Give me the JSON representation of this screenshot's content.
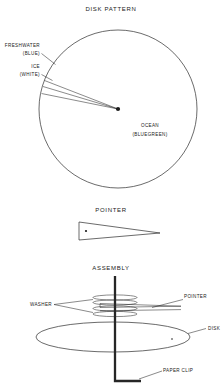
{
  "document": {
    "title": "Disk Pattern, Pointer and Assembly Diagram",
    "background_color": "#ffffff",
    "ink_color": "#2b2b2b"
  },
  "panels": {
    "disk_pattern": {
      "title": "DISK PATTERN",
      "labels": {
        "freshwater_line1": "FRESHWATER",
        "freshwater_line2": "(BLUE)",
        "ice_line1": "ICE",
        "ice_line2": "(WHITE)",
        "ocean_line1": "OCEAN",
        "ocean_line2": "(BLUEGREEN)"
      }
    },
    "pointer": {
      "title": "POINTER"
    },
    "assembly": {
      "title": "ASSEMBLY",
      "labels": {
        "washer": "WASHER",
        "pointer": "POINTER",
        "disk": "DISK",
        "paper_clip": "PAPER CLIP"
      }
    }
  }
}
